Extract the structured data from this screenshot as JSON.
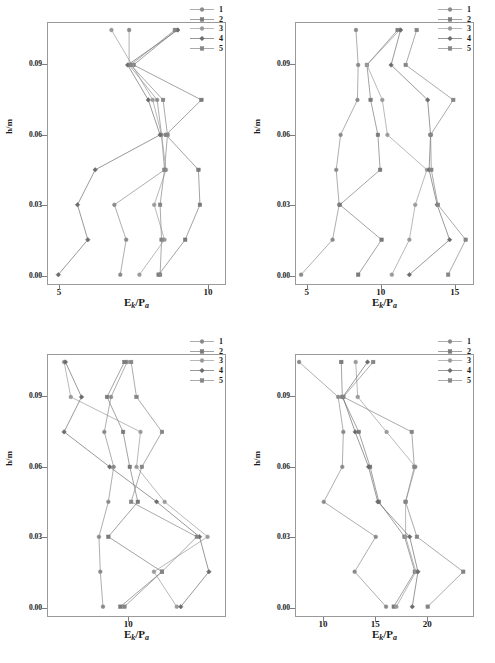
{
  "figure": {
    "axis": {
      "xlabel_main": "E",
      "xlabel_sub1": "k",
      "xlabel_mid": "/P",
      "xlabel_sub2": "a",
      "ylabel": "h/m"
    },
    "legend_labels": [
      "1",
      "2",
      "3",
      "4",
      "5"
    ],
    "series_colors": [
      "#8a8a8a",
      "#7a7a7a",
      "#9a9a9a",
      "#6b6b6b",
      "#858585"
    ]
  },
  "chart_data": [
    {
      "type": "line",
      "panel": "a",
      "title": "a",
      "xlabel": "Ek/Pa",
      "ylabel": "h/m",
      "xlim": [
        4.6,
        10.6
      ],
      "ylim": [
        -0.004,
        0.108
      ],
      "xticks": [
        5,
        10
      ],
      "yticks": [
        0.0,
        0.03,
        0.06,
        0.09
      ],
      "grid": false,
      "legend_position": "top-right",
      "y": [
        0.0,
        0.015,
        0.03,
        0.045,
        0.06,
        0.075,
        0.09,
        0.105
      ],
      "series": [
        {
          "name": "1",
          "values": [
            7.05,
            7.25,
            6.85,
            8.55,
            8.45,
            8.3,
            7.35,
            7.35
          ]
        },
        {
          "name": "2",
          "values": [
            8.35,
            9.25,
            9.75,
            9.7,
            8.6,
            9.8,
            7.5,
            8.95
          ]
        },
        {
          "name": "3",
          "values": [
            7.7,
            8.55,
            8.2,
            8.6,
            8.45,
            8.15,
            7.45,
            6.75
          ]
        },
        {
          "name": "4",
          "values": [
            4.95,
            5.95,
            5.6,
            6.2,
            8.4,
            8.0,
            7.3,
            9.0
          ]
        },
        {
          "name": "5",
          "values": [
            8.4,
            8.45,
            8.4,
            8.55,
            8.65,
            8.5,
            7.4,
            8.9
          ]
        }
      ]
    },
    {
      "type": "line",
      "panel": "b",
      "title": "b",
      "xlabel": "Ek/Pa",
      "ylabel": "h/m",
      "xlim": [
        4.2,
        16.3
      ],
      "ylim": [
        -0.004,
        0.108
      ],
      "xticks": [
        5,
        10,
        15
      ],
      "yticks": [
        0.0,
        0.03,
        0.06,
        0.09
      ],
      "grid": false,
      "legend_position": "top-right",
      "y": [
        0.0,
        0.015,
        0.03,
        0.045,
        0.06,
        0.075,
        0.09,
        0.105
      ],
      "series": [
        {
          "name": "1",
          "values": [
            4.55,
            6.7,
            7.15,
            6.95,
            7.25,
            8.4,
            8.45,
            8.3
          ]
        },
        {
          "name": "2",
          "values": [
            8.45,
            10.05,
            7.2,
            9.95,
            9.8,
            9.3,
            9.05,
            11.15
          ]
        },
        {
          "name": "3",
          "values": [
            10.75,
            11.95,
            12.35,
            13.15,
            10.45,
            10.1,
            9.05,
            11.3
          ]
        },
        {
          "name": "4",
          "values": [
            11.95,
            14.7,
            13.85,
            13.3,
            13.4,
            13.2,
            10.7,
            11.35
          ]
        },
        {
          "name": "5",
          "values": [
            14.6,
            15.8,
            13.9,
            13.45,
            13.4,
            14.95,
            11.7,
            12.45
          ]
        }
      ]
    },
    {
      "type": "line",
      "panel": "c",
      "title": "c",
      "xlabel": "Ek/Pa",
      "ylabel": "h/m",
      "xlim": [
        7.0,
        13.6
      ],
      "ylim": [
        -0.004,
        0.108
      ],
      "xticks": [
        10
      ],
      "yticks": [
        0.0,
        0.03,
        0.06,
        0.09
      ],
      "grid": false,
      "legend_position": "top-right",
      "y": [
        0.0,
        0.015,
        0.03,
        0.045,
        0.06,
        0.075,
        0.09,
        0.105
      ],
      "series": [
        {
          "name": "1",
          "values": [
            9.05,
            8.95,
            8.9,
            9.25,
            9.45,
            9.1,
            9.35,
            9.95
          ]
        },
        {
          "name": "2",
          "values": [
            9.7,
            11.25,
            9.25,
            10.35,
            10.05,
            9.8,
            9.2,
            9.85
          ]
        },
        {
          "name": "3",
          "values": [
            11.8,
            10.95,
            12.95,
            11.35,
            10.3,
            10.45,
            7.85,
            7.6
          ]
        },
        {
          "name": "4",
          "values": [
            11.95,
            13.0,
            12.65,
            11.05,
            9.3,
            7.6,
            8.25,
            7.65
          ]
        },
        {
          "name": "5",
          "values": [
            9.85,
            11.25,
            12.55,
            10.1,
            10.5,
            11.25,
            10.3,
            10.1
          ]
        }
      ]
    },
    {
      "type": "line",
      "panel": "d",
      "title": "d",
      "xlabel": "Ek/Pa",
      "ylabel": "h/m",
      "xlim": [
        7.3,
        24.5
      ],
      "ylim": [
        -0.004,
        0.108
      ],
      "xticks": [
        10,
        15,
        20
      ],
      "yticks": [
        0.0,
        0.03,
        0.06,
        0.09
      ],
      "grid": false,
      "legend_position": "top-right",
      "y": [
        0.0,
        0.015,
        0.03,
        0.045,
        0.06,
        0.075,
        0.09,
        0.105
      ],
      "series": [
        {
          "name": "1",
          "values": [
            16.05,
            13.0,
            15.05,
            10.0,
            11.8,
            11.9,
            11.4,
            7.6
          ]
        },
        {
          "name": "2",
          "values": [
            16.8,
            18.85,
            17.85,
            15.35,
            14.5,
            13.4,
            11.8,
            11.7
          ]
        },
        {
          "name": "3",
          "values": [
            17.05,
            18.95,
            17.95,
            17.95,
            18.9,
            16.1,
            13.3,
            13.1
          ]
        },
        {
          "name": "4",
          "values": [
            18.6,
            19.15,
            18.35,
            15.25,
            14.35,
            13.05,
            11.85,
            14.25
          ]
        },
        {
          "name": "5",
          "values": [
            20.1,
            23.55,
            19.05,
            17.95,
            18.8,
            18.55,
            11.9,
            14.8
          ]
        }
      ]
    }
  ]
}
